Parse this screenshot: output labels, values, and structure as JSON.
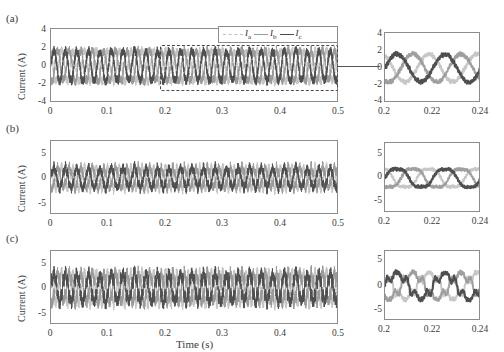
{
  "figure": {
    "panels": [
      "(a)",
      "(b)",
      "(c)"
    ],
    "xlabel": "Time (s)",
    "ylabel": "Current (A)"
  },
  "legend": {
    "entries": [
      {
        "label": "I",
        "sub": "a",
        "color": "#bdbdbd",
        "style": "dashed"
      },
      {
        "label": "I",
        "sub": "b",
        "color": "#9a9a9a",
        "style": "solid"
      },
      {
        "label": "I",
        "sub": "c",
        "color": "#4a4a4a",
        "style": "solid"
      }
    ]
  },
  "colors": {
    "trace_a": "#c4c4c4",
    "trace_b": "#9a9a9a",
    "trace_c": "#4f4f4f",
    "axis": "#8c8c8c",
    "text": "#3a3a3a"
  },
  "chart_data": {
    "type": "line",
    "title": "",
    "xlabel": "Time (s)",
    "ylabel": "Current (A)",
    "grid": false,
    "legend_position": "top-right-of-panel-a",
    "series_names": [
      "Ia",
      "Ib",
      "Ic"
    ],
    "panels": [
      {
        "id": "a",
        "label": "(a)",
        "main": {
          "xlim": [
            0,
            0.5
          ],
          "ylim": [
            -4,
            4
          ],
          "xticks": [
            0,
            0.1,
            0.2,
            0.3,
            0.4,
            0.5
          ],
          "xticklabels": [
            "0",
            "0.1",
            "0.2",
            "0.3",
            "0.4",
            "0.5"
          ],
          "yticks": [
            -4,
            -2,
            0,
            2,
            4
          ],
          "yticklabels": [
            "-4",
            "-2",
            "0",
            "2",
            "4"
          ],
          "fundamental_hz": 50,
          "amplitude": 1.7,
          "noise_amp": 0.55,
          "harmonics": [
            {
              "order": 3,
              "amp": 0.1
            }
          ],
          "zoom_box": {
            "x0": 0.2,
            "x1": 0.5,
            "y0": -2.6,
            "y1": 2.6
          }
        },
        "inset": {
          "xlim": [
            0.2,
            0.24
          ],
          "ylim": [
            -4,
            4
          ],
          "xticks": [
            0.2,
            0.22,
            0.24
          ],
          "xticklabels": [
            "0.2",
            "0.22",
            "0.24"
          ],
          "yticks": [
            -4,
            -2,
            0,
            2,
            4
          ],
          "yticklabels": [
            "-4",
            "-2",
            "0",
            "2",
            "4"
          ],
          "fundamental_hz": 50,
          "amplitude": 1.6,
          "noise_amp": 0.25,
          "harmonics": []
        }
      },
      {
        "id": "b",
        "label": "(b)",
        "main": {
          "xlim": [
            0,
            0.5
          ],
          "ylim": [
            -7,
            7
          ],
          "xticks": [
            0,
            0.1,
            0.2,
            0.3,
            0.4,
            0.5
          ],
          "xticklabels": [
            "0",
            "0.1",
            "0.2",
            "0.3",
            "0.4",
            "0.5"
          ],
          "yticks": [
            -5,
            0,
            5
          ],
          "yticklabels": [
            "-5",
            "0",
            "5"
          ],
          "fundamental_hz": 50,
          "amplitude": 1.9,
          "noise_amp": 0.9,
          "harmonics": [
            {
              "order": 5,
              "amp": 0.35
            }
          ],
          "zoom_box": null
        },
        "inset": {
          "xlim": [
            0.2,
            0.24
          ],
          "ylim": [
            -7,
            7
          ],
          "xticks": [
            0.2,
            0.22,
            0.24
          ],
          "xticklabels": [
            "0.2",
            "0.22",
            "0.24"
          ],
          "yticks": [
            -5,
            0,
            5
          ],
          "yticklabels": [
            "-5",
            "0",
            "5"
          ],
          "fundamental_hz": 50,
          "amplitude": 2.0,
          "noise_amp": 0.3,
          "harmonics": [
            {
              "order": 3,
              "amp": 0.25
            }
          ]
        }
      },
      {
        "id": "c",
        "label": "(c)",
        "main": {
          "xlim": [
            0,
            0.5
          ],
          "ylim": [
            -7,
            7
          ],
          "xticks": [
            0,
            0.1,
            0.2,
            0.3,
            0.4,
            0.5
          ],
          "xticklabels": [
            "0",
            "0.1",
            "0.2",
            "0.3",
            "0.4",
            "0.5"
          ],
          "yticks": [
            -5,
            0,
            5
          ],
          "yticklabels": [
            "-5",
            "0",
            "5"
          ],
          "fundamental_hz": 50,
          "amplitude": 2.6,
          "noise_amp": 1.3,
          "harmonics": [
            {
              "order": 5,
              "amp": 0.6
            },
            {
              "order": 7,
              "amp": 0.35
            }
          ],
          "zoom_box": null
        },
        "inset": {
          "xlim": [
            0.2,
            0.24
          ],
          "ylim": [
            -7,
            7
          ],
          "xticks": [
            0.2,
            0.22,
            0.24
          ],
          "xticklabels": [
            "0.2",
            "0.22",
            "0.24"
          ],
          "yticks": [
            -5,
            0,
            5
          ],
          "yticklabels": [
            "-5",
            "0",
            "5"
          ],
          "fundamental_hz": 50,
          "amplitude": 2.4,
          "noise_amp": 0.45,
          "harmonics": [
            {
              "order": 5,
              "amp": 0.7
            },
            {
              "order": 7,
              "amp": 0.4
            }
          ]
        }
      }
    ]
  }
}
